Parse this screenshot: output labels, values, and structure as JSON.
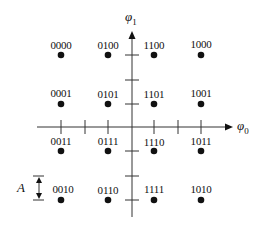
{
  "diagram": {
    "type": "16-QAM signal constellation",
    "axes": {
      "horizontal": {
        "label": "φ",
        "subscript": "0"
      },
      "vertical": {
        "label": "φ",
        "subscript": "1"
      }
    },
    "spacing_label": "A",
    "colors": {
      "ink": "#111111",
      "axis": "#333333",
      "background": "#ffffff"
    },
    "points": [
      {
        "code": "0000",
        "col": 0,
        "row": 0
      },
      {
        "code": "0100",
        "col": 1,
        "row": 0
      },
      {
        "code": "1100",
        "col": 2,
        "row": 0
      },
      {
        "code": "1000",
        "col": 3,
        "row": 0
      },
      {
        "code": "0001",
        "col": 0,
        "row": 1
      },
      {
        "code": "0101",
        "col": 1,
        "row": 1
      },
      {
        "code": "1101",
        "col": 2,
        "row": 1
      },
      {
        "code": "1001",
        "col": 3,
        "row": 1
      },
      {
        "code": "0011",
        "col": 0,
        "row": 2
      },
      {
        "code": "0111",
        "col": 1,
        "row": 2
      },
      {
        "code": "1110",
        "col": 2,
        "row": 2
      },
      {
        "code": "1011",
        "col": 3,
        "row": 2
      },
      {
        "code": "0010",
        "col": 0,
        "row": 3
      },
      {
        "code": "0110",
        "col": 1,
        "row": 3
      },
      {
        "code": "1111",
        "col": 2,
        "row": 3
      },
      {
        "code": "1010",
        "col": 3,
        "row": 3
      }
    ]
  }
}
